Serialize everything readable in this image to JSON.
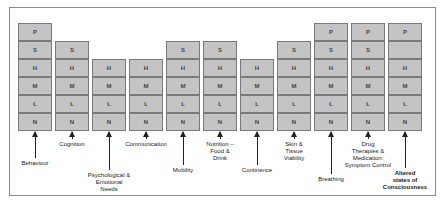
{
  "diagram": {
    "levels": [
      "P",
      "S",
      "H",
      "M",
      "L",
      "N"
    ],
    "columns": [
      {
        "label": "Behaviour",
        "cells": [
          "P",
          "S",
          "H",
          "M",
          "L",
          "N"
        ],
        "label_y": 160,
        "bold": false
      },
      {
        "label": "Cognition",
        "cells": [
          "S",
          "H",
          "M",
          "L",
          "N"
        ],
        "label_y": 141,
        "bold": false
      },
      {
        "label": "Psychological &\nEmotional\nNeeds",
        "cells": [
          "H",
          "M",
          "L",
          "N"
        ],
        "label_y": 172,
        "bold": false
      },
      {
        "label": "Communication",
        "cells": [
          "H",
          "M",
          "L",
          "N"
        ],
        "label_y": 141,
        "bold": false
      },
      {
        "label": "Mobility",
        "cells": [
          "S",
          "H",
          "M",
          "L",
          "N"
        ],
        "label_y": 167,
        "bold": false
      },
      {
        "label": "Nutrition –\nFood &\nDrink",
        "cells": [
          "S",
          "H",
          "M",
          "L",
          "N"
        ],
        "label_y": 141,
        "bold": false
      },
      {
        "label": "Continence",
        "cells": [
          "H",
          "M",
          "L",
          "N"
        ],
        "label_y": 167,
        "bold": false
      },
      {
        "label": "Skin &\nTissue\nViability",
        "cells": [
          "S",
          "H",
          "M",
          "L",
          "N"
        ],
        "label_y": 141,
        "bold": false
      },
      {
        "label": "Breathing",
        "cells": [
          "P",
          "S",
          "H",
          "M",
          "L",
          "N"
        ],
        "label_y": 176,
        "bold": false
      },
      {
        "label": "Drug\nTherapies &\nMedication:\nSymptom Control",
        "cells": [
          "P",
          "S",
          "H",
          "M",
          "L",
          "N"
        ],
        "label_y": 141,
        "bold": false
      },
      {
        "label": "Altered\nstates of\nConsciousness",
        "cells": [
          "P",
          "",
          "H",
          "M",
          "L",
          "N"
        ],
        "label_y": 170,
        "bold": true
      }
    ]
  },
  "colors": {
    "cell_fill": "#c4c4c4",
    "cell_border": "#7a7a7a",
    "frame_border": "#8a8a8a",
    "arrow": "#222222"
  }
}
